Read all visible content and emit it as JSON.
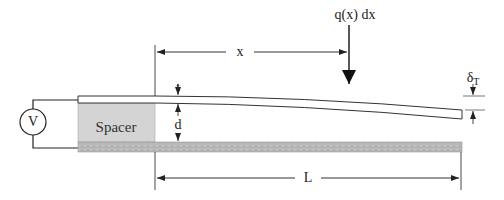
{
  "diagram": {
    "title": "",
    "labels": {
      "x": "x",
      "load": "q(x) dx",
      "thickness": "t",
      "gap": "d",
      "tip_deflection_symbol": "δ",
      "tip_deflection_subscript": "T",
      "length": "L",
      "spacer": "Spacer",
      "voltage_source": "V"
    },
    "colors": {
      "line": "#222222",
      "spacer_fill": "#d4d4d4",
      "bottom_plate_fill": "#b8b8b8",
      "beam_fill": "#ffffff"
    },
    "nodes": [
      {
        "id": "voltage-source",
        "label": "V",
        "shape": "circle"
      },
      {
        "id": "spacer",
        "label": "Spacer",
        "shape": "rect"
      },
      {
        "id": "cantilever-beam",
        "label": "",
        "shape": "deflected-beam"
      },
      {
        "id": "bottom-electrode",
        "label": "",
        "shape": "rect"
      }
    ],
    "edges": [
      {
        "from": "voltage-source",
        "to": "cantilever-beam",
        "type": "wire"
      },
      {
        "from": "voltage-source",
        "to": "bottom-electrode",
        "type": "wire"
      }
    ],
    "dimensions": [
      {
        "name": "x",
        "from": "beam-root",
        "to": "load-position"
      },
      {
        "name": "L",
        "from": "beam-root",
        "to": "beam-tip"
      },
      {
        "name": "t",
        "type": "beam-thickness"
      },
      {
        "name": "d",
        "type": "gap-height"
      },
      {
        "name": "δT",
        "type": "tip-deflection"
      }
    ]
  }
}
